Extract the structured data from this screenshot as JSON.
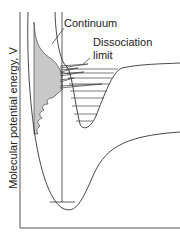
{
  "diagram": {
    "type": "potential-energy-curves-predissociation-spectrum",
    "y_axis_label": "Molecular potential energy, V",
    "labels": {
      "continuum": "Continuum",
      "dissociation_limit_line1": "Dissociation",
      "dissociation_limit_line2": "limit"
    },
    "colors": {
      "line": "#333333",
      "spectrum_fill": "#c8c8c8",
      "background": "#ffffff"
    }
  }
}
